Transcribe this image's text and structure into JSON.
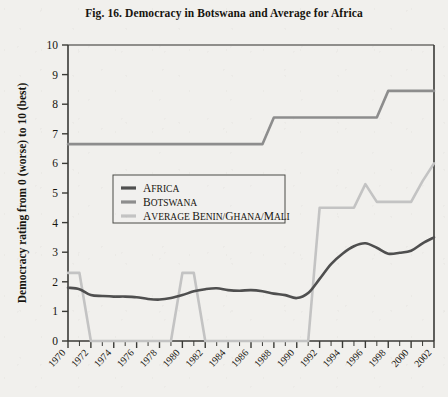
{
  "figure": {
    "title": "Fig. 16. Democracy in Botswana and Average for Africa",
    "y_axis_title": "Democracy rating from 0 (worse) to 10 (best)"
  },
  "colors": {
    "africa": "#4f4f4f",
    "botswana": "#8d8d8d",
    "average": "#c3c3c3",
    "axis": "#3a3a36",
    "text": "#17150f",
    "paper": "#f1f0ed"
  },
  "legend": {
    "position": "inside-upper-left",
    "items": [
      {
        "label": "Africa",
        "color_key": "africa"
      },
      {
        "label": "Botswana",
        "color_key": "botswana"
      },
      {
        "label": "Average Benin/Ghana/Mali",
        "color_key": "average"
      }
    ]
  },
  "chart_data": {
    "type": "line",
    "title": "Fig. 16. Democracy in Botswana and Average for Africa",
    "xlabel": "",
    "ylabel": "Democracy rating from 0 (worse) to 10 (best)",
    "xlim": [
      1970,
      2002
    ],
    "ylim": [
      0,
      10
    ],
    "grid": false,
    "legend_position": "inside-upper-left",
    "x": [
      1970,
      1971,
      1972,
      1973,
      1974,
      1975,
      1976,
      1977,
      1978,
      1979,
      1980,
      1981,
      1982,
      1983,
      1984,
      1985,
      1986,
      1987,
      1988,
      1989,
      1990,
      1991,
      1992,
      1993,
      1994,
      1995,
      1996,
      1997,
      1998,
      1999,
      2000,
      2001,
      2002
    ],
    "xticklabels": [
      "1970",
      "1972",
      "1974",
      "1976",
      "1978",
      "1980",
      "1982",
      "1984",
      "1986",
      "1988",
      "1990",
      "1992",
      "1994",
      "1996",
      "1998",
      "2000",
      "2002"
    ],
    "yticklabels": [
      "0",
      "1",
      "2",
      "3",
      "4",
      "5",
      "6",
      "7",
      "8",
      "9",
      "10"
    ],
    "series": [
      {
        "name": "Africa",
        "color": "#4f4f4f",
        "values": [
          1.8,
          1.75,
          1.55,
          1.52,
          1.5,
          1.5,
          1.48,
          1.42,
          1.4,
          1.45,
          1.55,
          1.68,
          1.75,
          1.78,
          1.72,
          1.7,
          1.72,
          1.68,
          1.6,
          1.55,
          1.45,
          1.62,
          2.1,
          2.6,
          2.95,
          3.2,
          3.3,
          3.15,
          2.95,
          2.98,
          3.05,
          3.3,
          3.5
        ]
      },
      {
        "name": "Botswana",
        "color": "#8d8d8d",
        "values": [
          6.65,
          6.65,
          6.65,
          6.65,
          6.65,
          6.65,
          6.65,
          6.65,
          6.65,
          6.65,
          6.65,
          6.65,
          6.65,
          6.65,
          6.65,
          6.65,
          6.65,
          6.65,
          7.55,
          7.55,
          7.55,
          7.55,
          7.55,
          7.55,
          7.55,
          7.55,
          7.55,
          7.55,
          8.45,
          8.45,
          8.45,
          8.45,
          8.45
        ]
      },
      {
        "name": "Average Benin/Ghana/Mali",
        "color": "#c3c3c3",
        "values": [
          2.3,
          2.3,
          0.0,
          0.0,
          0.0,
          0.0,
          0.0,
          0.0,
          0.0,
          0.0,
          2.3,
          2.3,
          0.0,
          0.0,
          0.0,
          0.0,
          0.0,
          0.0,
          0.0,
          0.0,
          0.0,
          0.0,
          4.5,
          4.5,
          4.5,
          4.5,
          5.3,
          4.7,
          4.7,
          4.7,
          4.7,
          5.4,
          6.0
        ]
      }
    ]
  }
}
